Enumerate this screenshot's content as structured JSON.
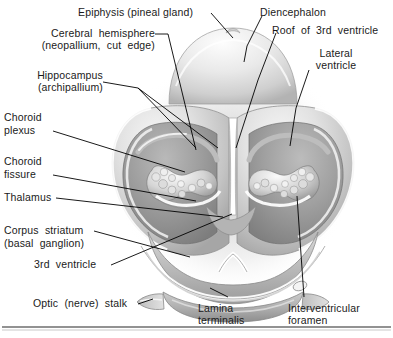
{
  "figure": {
    "type": "anatomical-illustration",
    "style": "grayscale halftone airbrush drawing with leader-line labels",
    "rule_color": "#6e6e6e",
    "label_color": "#1a1a1a",
    "leader_color": "#000000"
  },
  "labels": {
    "epiphysis": "Epiphysis (pineal gland)",
    "cerebral_hemisphere_l1": "Cerebral  hemisphere",
    "cerebral_hemisphere_l2": "(neopallium,  cut  edge)",
    "hippocampus_l1": "Hippocampus",
    "hippocampus_l2": "(archipallium)",
    "choroid_plexus_l1": "Choroid",
    "choroid_plexus_l2": "plexus",
    "choroid_fissure_l1": "Choroid",
    "choroid_fissure_l2": "fissure",
    "thalamus": "Thalamus",
    "corpus_striatum_l1": "Corpus  striatum",
    "corpus_striatum_l2": "(basal  ganglion)",
    "third_ventricle": "3rd  ventricle",
    "optic_stalk": "Optic  (nerve)  stalk",
    "diencephalon": "Diencephalon",
    "roof_third_ventricle": "Roof  of  3rd  ventricle",
    "lateral_ventricle_l1": "Lateral",
    "lateral_ventricle_l2": "ventricle",
    "lamina_terminalis_l1": "Lamina",
    "lamina_terminalis_l2": "terminalis",
    "interventricular_foramen_l1": "Interventricular",
    "interventricular_foramen_l2": "foramen"
  }
}
